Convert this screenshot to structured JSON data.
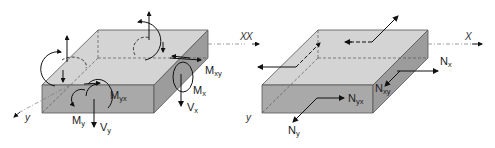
{
  "figure": {
    "left_panel": {
      "title": "Moments and shear forces on plate element",
      "axes": {
        "x": "X",
        "y": "y"
      },
      "labels": [
        {
          "main": "M",
          "sub": "xy"
        },
        {
          "main": "M",
          "sub": "x"
        },
        {
          "main": "V",
          "sub": "x"
        },
        {
          "main": "M",
          "sub": "yx"
        },
        {
          "main": "M",
          "sub": "y"
        },
        {
          "main": "V",
          "sub": "y"
        }
      ]
    },
    "right_panel": {
      "title": "Membrane forces on plate element",
      "axes": {
        "x": "X",
        "x_left": "X",
        "y": "y"
      },
      "labels": [
        {
          "main": "N",
          "sub": "x"
        },
        {
          "main": "N",
          "sub": "xy"
        },
        {
          "main": "N",
          "sub": "yx"
        },
        {
          "main": "N",
          "sub": "y"
        }
      ]
    },
    "colors": {
      "top_face": "#d2d2d2",
      "front_face": "#a8a8a8",
      "side_face": "#9a9a9a",
      "edge": "#555555",
      "arrow": "#111111"
    }
  }
}
